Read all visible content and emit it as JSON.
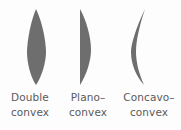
{
  "figure": {
    "background_color": "#fdfdfd",
    "lens_fill_color": "#6e6e6e",
    "label_color": "#5a5a5a",
    "items": [
      {
        "shape_name": "double-convex-lens",
        "label_line1": "Double",
        "label_line2": "convex",
        "description": "biconvex lens, both surfaces curved outward"
      },
      {
        "shape_name": "plano-convex-lens",
        "label_line1": "Plano–",
        "label_line2": "convex",
        "description": "one flat surface, one convex surface"
      },
      {
        "shape_name": "concavo-convex-lens",
        "label_line1": "Concavo–",
        "label_line2": "convex",
        "description": "meniscus lens, one concave and one convex surface"
      }
    ]
  }
}
